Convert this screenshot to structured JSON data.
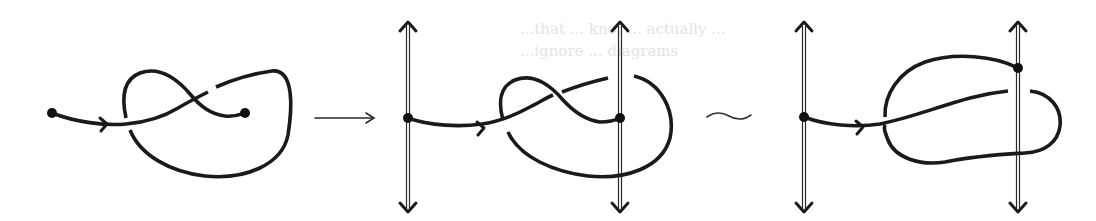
{
  "figure": {
    "panels": [
      {
        "id": "panel-1",
        "label": "knotted arc with two endpoints"
      },
      {
        "id": "panel-2",
        "label": "arc endpoints attached to two vertical double-line rails"
      },
      {
        "id": "panel-3",
        "label": "equivalent arc after isotopy, endpoint moved up right rail"
      }
    ],
    "operators": {
      "maps_to": "→",
      "equivalent": "∼"
    },
    "colors": {
      "ink": "#1a1a1a",
      "background": "#ffffff",
      "bleed_through_text": "#e4e4e4"
    }
  },
  "bleed_through": {
    "line_1": "...that ... knot ... actually ...",
    "line_2": "...ignore ... diagrams",
    "note": "faint mirrored text from reverse of scanned page, largely illegible"
  }
}
